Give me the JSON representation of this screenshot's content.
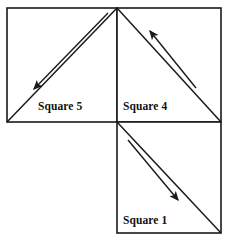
{
  "figure": {
    "background_color": "#ffffff",
    "stroke_color": "#1a1a1a",
    "text_color": "#111111",
    "canvas": {
      "width": 225,
      "height": 240
    },
    "squares": [
      {
        "id": "square-5",
        "label": "Square 5",
        "x": 7,
        "y": 8,
        "width": 110,
        "height": 114,
        "label_x": 38,
        "label_y": 110,
        "diagonal": {
          "x1": 7,
          "y1": 122,
          "x2": 117,
          "y2": 8
        }
      },
      {
        "id": "square-4",
        "label": "Square 4",
        "x": 117,
        "y": 8,
        "width": 104,
        "height": 114,
        "label_x": 123,
        "label_y": 110,
        "diagonal": {
          "x1": 117,
          "y1": 8,
          "x2": 221,
          "y2": 122
        }
      },
      {
        "id": "square-1",
        "label": "Square 1",
        "x": 117,
        "y": 122,
        "width": 104,
        "height": 111,
        "label_x": 123,
        "label_y": 224,
        "diagonal": {
          "x1": 117,
          "y1": 122,
          "x2": 221,
          "y2": 233
        }
      }
    ],
    "arrows": [
      {
        "id": "arrow-square-5",
        "direction": "down-left",
        "tail_x": 108,
        "tail_y": 13,
        "head_x": 31,
        "head_y": 92,
        "in_square": "Square 5"
      },
      {
        "id": "arrow-square-4",
        "direction": "up-left",
        "tail_x": 196,
        "tail_y": 88,
        "head_x": 147,
        "head_y": 28,
        "in_square": "Square 4"
      },
      {
        "id": "arrow-square-1",
        "direction": "down-right",
        "tail_x": 128,
        "tail_y": 140,
        "head_x": 181,
        "head_y": 203,
        "in_square": "Square 1"
      }
    ]
  }
}
